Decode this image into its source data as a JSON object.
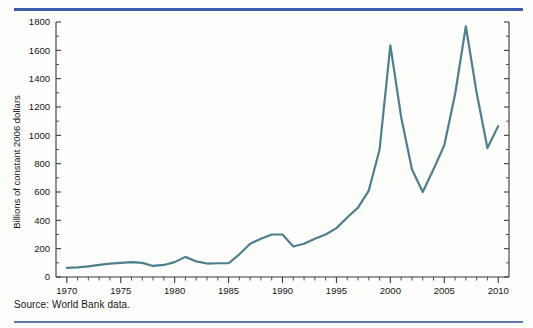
{
  "figure": {
    "source_note": "Source: World Bank data.",
    "accent_rule_color": "#3b5ca8",
    "line_color": "#4d7f8d"
  },
  "chart_data": {
    "type": "line",
    "title": "",
    "subtitle": "",
    "xlabel": "",
    "ylabel": "Billions of constant 2006 dollars",
    "xlim": [
      1969,
      2011
    ],
    "ylim": [
      0,
      1800
    ],
    "grid": false,
    "legend": "none",
    "x_major_ticks": [
      1970,
      1975,
      1980,
      1985,
      1990,
      1995,
      2000,
      2005,
      2010
    ],
    "x_major_tick_labels": [
      "1970",
      "1975",
      "1980",
      "1985",
      "1990",
      "1995",
      "2000",
      "2005",
      "2010"
    ],
    "x_minor_tick_step": 1,
    "y_ticks": [
      0,
      200,
      400,
      600,
      800,
      1000,
      1200,
      1400,
      1600,
      1800
    ],
    "y_tick_labels": [
      "0",
      "200",
      "400",
      "600",
      "800",
      "1000",
      "1200",
      "1400",
      "1600",
      "1800"
    ],
    "y_minor_tick_step": 100,
    "right_axis_ticks": true,
    "series": [
      {
        "name": "Net private capital flows to developing countries",
        "color": "#4d7f8d",
        "x": [
          1970,
          1971,
          1972,
          1973,
          1974,
          1975,
          1976,
          1977,
          1978,
          1979,
          1980,
          1981,
          1982,
          1983,
          1984,
          1985,
          1986,
          1987,
          1988,
          1989,
          1990,
          1991,
          1992,
          1993,
          1994,
          1995,
          1996,
          1997,
          1998,
          1999,
          2000,
          2001,
          2002,
          2003,
          2004,
          2005,
          2006,
          2007,
          2008,
          2009,
          2010
        ],
        "values": [
          65,
          68,
          75,
          85,
          95,
          100,
          105,
          100,
          78,
          85,
          105,
          142,
          110,
          95,
          97,
          97,
          160,
          235,
          270,
          300,
          300,
          215,
          235,
          270,
          300,
          345,
          420,
          490,
          610,
          900,
          1635,
          1130,
          760,
          600,
          760,
          930,
          1290,
          1770,
          1300,
          910,
          1065
        ]
      }
    ]
  }
}
